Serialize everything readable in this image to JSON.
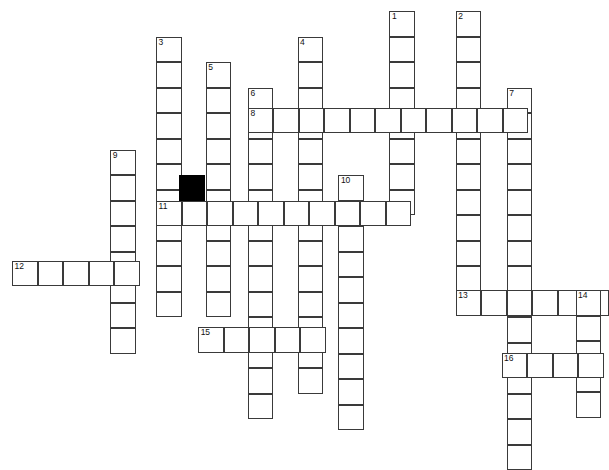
{
  "puzzle": {
    "type": "crossword-grid",
    "title": "Crossword puzzle grid",
    "canvas": {
      "width": 608,
      "height": 416
    },
    "geometry": {
      "cell_size": 25.5,
      "origin_x": 12,
      "origin_y": 11,
      "border_color": "#3a3a3a",
      "cell_fill": "#ffffff",
      "block_fill": "#000000",
      "page_background": "#ffffff"
    },
    "clue_numbers_visible": [
      1,
      2,
      3,
      4,
      5,
      6,
      7,
      8,
      9,
      10,
      11,
      12,
      13,
      14,
      15,
      16
    ],
    "entries": [
      {
        "number": "1",
        "direction": "down",
        "col": 14.8,
        "row": 0,
        "length": 8,
        "label_cell": true
      },
      {
        "number": "2",
        "direction": "down",
        "col": 17.4,
        "row": 0,
        "length": 11,
        "label_cell": true
      },
      {
        "number": "3",
        "direction": "down",
        "col": 5.65,
        "row": 1,
        "length": 11,
        "label_cell": true
      },
      {
        "number": "4",
        "direction": "down",
        "col": 11.2,
        "row": 1,
        "length": 14,
        "label_cell": true
      },
      {
        "number": "5",
        "direction": "down",
        "col": 7.6,
        "row": 2,
        "length": 10,
        "label_cell": true
      },
      {
        "number": "6",
        "direction": "down",
        "col": 9.25,
        "row": 3,
        "length": 13,
        "label_cell": true
      },
      {
        "number": "7",
        "direction": "down",
        "col": 19.4,
        "row": 3,
        "length": 15,
        "label_cell": true
      },
      {
        "number": "8",
        "direction": "across",
        "col": 9.25,
        "row": 3.8,
        "length": 11,
        "label_cell": true
      },
      {
        "number": "9",
        "direction": "down",
        "col": 3.85,
        "row": 5.45,
        "length": 8,
        "label_cell": true
      },
      {
        "number": "10",
        "direction": "down",
        "col": 12.8,
        "row": 6.45,
        "length": 10,
        "label_cell": true
      },
      {
        "number": "11",
        "direction": "across",
        "col": 5.65,
        "row": 7.45,
        "length": 10,
        "label_cell": true
      },
      {
        "number": "12",
        "direction": "across",
        "col": 0,
        "row": 9.8,
        "length": 5,
        "label_cell": true
      },
      {
        "number": "13",
        "direction": "across",
        "col": 17.4,
        "row": 10.95,
        "length": 6,
        "label_cell": true
      },
      {
        "number": "14",
        "direction": "down",
        "col": 22.1,
        "row": 10.95,
        "length": 5,
        "label_cell": true
      },
      {
        "number": "15",
        "direction": "across",
        "col": 7.3,
        "row": 12.4,
        "length": 5,
        "label_cell": true
      },
      {
        "number": "16",
        "direction": "across",
        "col": 19.2,
        "row": 13.4,
        "length": 4,
        "label_cell": true
      }
    ],
    "blocked_cells": [
      {
        "col": 6.55,
        "row": 6.45
      }
    ]
  }
}
